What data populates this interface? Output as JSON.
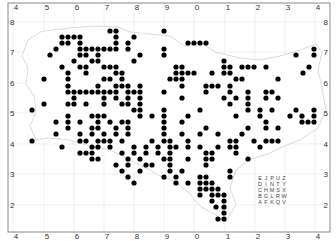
{
  "map": {
    "type": "dot-distribution-map",
    "frame": {
      "left": 8,
      "top": 3,
      "right": 330,
      "bottom": 232
    },
    "colors": {
      "dot": "#000000",
      "grid": "#e6e6e6",
      "coast": "#cfcfcf",
      "frame": "#888888",
      "text": "#333333",
      "land": "#ffffff"
    },
    "x_ticks": [
      {
        "label": "4",
        "x": 16
      },
      {
        "label": "5",
        "x": 47
      },
      {
        "label": "6",
        "x": 77
      },
      {
        "label": "7",
        "x": 107
      },
      {
        "label": "8",
        "x": 137
      },
      {
        "label": "9",
        "x": 167
      },
      {
        "label": "0",
        "x": 197
      },
      {
        "label": "1",
        "x": 228
      },
      {
        "label": "2",
        "x": 258
      },
      {
        "label": "3",
        "x": 288
      },
      {
        "label": "4",
        "x": 318
      }
    ],
    "y_ticks": [
      {
        "label": "8",
        "y": 22
      },
      {
        "label": "7",
        "y": 52
      },
      {
        "label": "6",
        "y": 83
      },
      {
        "label": "5",
        "y": 113
      },
      {
        "label": "4",
        "y": 144
      },
      {
        "label": "3",
        "y": 174
      },
      {
        "label": "2",
        "y": 205
      }
    ],
    "legend_grid": {
      "x": 257,
      "y": 175,
      "cell": 6,
      "rows": [
        [
          "E",
          "J",
          "P",
          "U",
          "Z"
        ],
        [
          "D",
          "I",
          "N",
          "T",
          "Y"
        ],
        [
          "C",
          "H",
          "M",
          "S",
          "X"
        ],
        [
          "B",
          "G",
          "L",
          "R",
          "W"
        ],
        [
          "A",
          "F",
          "K",
          "Q",
          "V"
        ]
      ]
    },
    "dots": [
      [
        110,
        31
      ],
      [
        116,
        31
      ],
      [
        164,
        31
      ],
      [
        62,
        37
      ],
      [
        68,
        37
      ],
      [
        74,
        37
      ],
      [
        80,
        37
      ],
      [
        116,
        37
      ],
      [
        134,
        37
      ],
      [
        188,
        43
      ],
      [
        194,
        43
      ],
      [
        200,
        43
      ],
      [
        206,
        43
      ],
      [
        62,
        43
      ],
      [
        68,
        43
      ],
      [
        80,
        43
      ],
      [
        116,
        43
      ],
      [
        128,
        43
      ],
      [
        56,
        49
      ],
      [
        80,
        49
      ],
      [
        86,
        49
      ],
      [
        92,
        49
      ],
      [
        98,
        49
      ],
      [
        104,
        49
      ],
      [
        110,
        49
      ],
      [
        116,
        49
      ],
      [
        128,
        49
      ],
      [
        164,
        49
      ],
      [
        314,
        49
      ],
      [
        50,
        55
      ],
      [
        80,
        55
      ],
      [
        86,
        55
      ],
      [
        98,
        55
      ],
      [
        140,
        55
      ],
      [
        164,
        55
      ],
      [
        296,
        55
      ],
      [
        314,
        55
      ],
      [
        74,
        61
      ],
      [
        92,
        61
      ],
      [
        98,
        61
      ],
      [
        134,
        61
      ],
      [
        224,
        61
      ],
      [
        62,
        67
      ],
      [
        80,
        67
      ],
      [
        86,
        67
      ],
      [
        104,
        67
      ],
      [
        110,
        67
      ],
      [
        116,
        67
      ],
      [
        176,
        67
      ],
      [
        182,
        67
      ],
      [
        224,
        67
      ],
      [
        230,
        67
      ],
      [
        242,
        67
      ],
      [
        248,
        67
      ],
      [
        254,
        67
      ],
      [
        266,
        67
      ],
      [
        309,
        67
      ],
      [
        68,
        73
      ],
      [
        86,
        73
      ],
      [
        116,
        73
      ],
      [
        122,
        73
      ],
      [
        176,
        73
      ],
      [
        182,
        73
      ],
      [
        188,
        73
      ],
      [
        194,
        73
      ],
      [
        212,
        73
      ],
      [
        224,
        73
      ],
      [
        230,
        73
      ],
      [
        303,
        73
      ],
      [
        44,
        79
      ],
      [
        68,
        79
      ],
      [
        104,
        79
      ],
      [
        110,
        79
      ],
      [
        122,
        79
      ],
      [
        170,
        79
      ],
      [
        176,
        79
      ],
      [
        182,
        79
      ],
      [
        236,
        79
      ],
      [
        242,
        79
      ],
      [
        278,
        79
      ],
      [
        68,
        86
      ],
      [
        98,
        86
      ],
      [
        116,
        86
      ],
      [
        122,
        86
      ],
      [
        128,
        86
      ],
      [
        140,
        86
      ],
      [
        182,
        86
      ],
      [
        206,
        86
      ],
      [
        212,
        86
      ],
      [
        218,
        86
      ],
      [
        230,
        86
      ],
      [
        68,
        92
      ],
      [
        74,
        92
      ],
      [
        80,
        92
      ],
      [
        86,
        92
      ],
      [
        92,
        92
      ],
      [
        98,
        92
      ],
      [
        104,
        92
      ],
      [
        110,
        92
      ],
      [
        116,
        92
      ],
      [
        128,
        92
      ],
      [
        134,
        92
      ],
      [
        140,
        92
      ],
      [
        164,
        92
      ],
      [
        206,
        92
      ],
      [
        230,
        92
      ],
      [
        248,
        92
      ],
      [
        266,
        92
      ],
      [
        272,
        92
      ],
      [
        74,
        98
      ],
      [
        104,
        98
      ],
      [
        116,
        98
      ],
      [
        128,
        98
      ],
      [
        140,
        98
      ],
      [
        182,
        98
      ],
      [
        224,
        98
      ],
      [
        236,
        98
      ],
      [
        248,
        98
      ],
      [
        266,
        98
      ],
      [
        278,
        98
      ],
      [
        44,
        104
      ],
      [
        68,
        104
      ],
      [
        74,
        104
      ],
      [
        86,
        104
      ],
      [
        104,
        104
      ],
      [
        122,
        104
      ],
      [
        128,
        104
      ],
      [
        140,
        104
      ],
      [
        230,
        104
      ],
      [
        248,
        104
      ],
      [
        32,
        110
      ],
      [
        134,
        110
      ],
      [
        140,
        110
      ],
      [
        164,
        110
      ],
      [
        200,
        110
      ],
      [
        248,
        110
      ],
      [
        260,
        110
      ],
      [
        272,
        110
      ],
      [
        296,
        110
      ],
      [
        314,
        110
      ],
      [
        68,
        116
      ],
      [
        92,
        116
      ],
      [
        98,
        116
      ],
      [
        104,
        116
      ],
      [
        140,
        116
      ],
      [
        152,
        116
      ],
      [
        164,
        116
      ],
      [
        188,
        116
      ],
      [
        236,
        116
      ],
      [
        260,
        116
      ],
      [
        290,
        116
      ],
      [
        302,
        116
      ],
      [
        314,
        116
      ],
      [
        56,
        122
      ],
      [
        68,
        122
      ],
      [
        80,
        122
      ],
      [
        98,
        122
      ],
      [
        110,
        122
      ],
      [
        122,
        122
      ],
      [
        128,
        122
      ],
      [
        164,
        122
      ],
      [
        182,
        122
      ],
      [
        266,
        122
      ],
      [
        302,
        122
      ],
      [
        308,
        122
      ],
      [
        314,
        122
      ],
      [
        68,
        128
      ],
      [
        92,
        128
      ],
      [
        98,
        128
      ],
      [
        116,
        128
      ],
      [
        128,
        128
      ],
      [
        164,
        128
      ],
      [
        206,
        128
      ],
      [
        248,
        128
      ],
      [
        266,
        128
      ],
      [
        278,
        128
      ],
      [
        56,
        134
      ],
      [
        80,
        134
      ],
      [
        92,
        134
      ],
      [
        104,
        134
      ],
      [
        116,
        134
      ],
      [
        128,
        134
      ],
      [
        164,
        134
      ],
      [
        182,
        134
      ],
      [
        200,
        134
      ],
      [
        218,
        134
      ],
      [
        242,
        134
      ],
      [
        32,
        141
      ],
      [
        80,
        141
      ],
      [
        86,
        141
      ],
      [
        98,
        141
      ],
      [
        104,
        141
      ],
      [
        110,
        141
      ],
      [
        122,
        141
      ],
      [
        152,
        141
      ],
      [
        164,
        141
      ],
      [
        170,
        141
      ],
      [
        188,
        141
      ],
      [
        230,
        141
      ],
      [
        236,
        141
      ],
      [
        254,
        141
      ],
      [
        266,
        141
      ],
      [
        272,
        141
      ],
      [
        278,
        141
      ],
      [
        62,
        147
      ],
      [
        92,
        147
      ],
      [
        98,
        147
      ],
      [
        110,
        147
      ],
      [
        134,
        147
      ],
      [
        146,
        147
      ],
      [
        158,
        147
      ],
      [
        170,
        147
      ],
      [
        176,
        147
      ],
      [
        188,
        147
      ],
      [
        200,
        147
      ],
      [
        218,
        147
      ],
      [
        230,
        147
      ],
      [
        236,
        147
      ],
      [
        260,
        147
      ],
      [
        80,
        153
      ],
      [
        86,
        153
      ],
      [
        92,
        153
      ],
      [
        122,
        153
      ],
      [
        134,
        153
      ],
      [
        146,
        153
      ],
      [
        158,
        153
      ],
      [
        170,
        153
      ],
      [
        206,
        153
      ],
      [
        212,
        153
      ],
      [
        236,
        153
      ],
      [
        92,
        159
      ],
      [
        98,
        159
      ],
      [
        128,
        159
      ],
      [
        140,
        159
      ],
      [
        164,
        159
      ],
      [
        170,
        159
      ],
      [
        188,
        159
      ],
      [
        206,
        159
      ],
      [
        212,
        159
      ],
      [
        248,
        159
      ],
      [
        116,
        165
      ],
      [
        128,
        165
      ],
      [
        146,
        165
      ],
      [
        152,
        165
      ],
      [
        170,
        165
      ],
      [
        206,
        165
      ],
      [
        122,
        171
      ],
      [
        140,
        171
      ],
      [
        170,
        171
      ],
      [
        182,
        171
      ],
      [
        230,
        171
      ],
      [
        128,
        177
      ],
      [
        164,
        177
      ],
      [
        176,
        177
      ],
      [
        200,
        177
      ],
      [
        206,
        177
      ],
      [
        230,
        177
      ],
      [
        134,
        183
      ],
      [
        176,
        183
      ],
      [
        188,
        183
      ],
      [
        200,
        183
      ],
      [
        206,
        183
      ],
      [
        212,
        183
      ],
      [
        200,
        189
      ],
      [
        206,
        189
      ],
      [
        212,
        189
      ],
      [
        218,
        189
      ],
      [
        200,
        195
      ],
      [
        212,
        195
      ],
      [
        218,
        195
      ],
      [
        224,
        195
      ],
      [
        212,
        201
      ],
      [
        224,
        201
      ],
      [
        216,
        207
      ],
      [
        224,
        207
      ],
      [
        224,
        213
      ],
      [
        224,
        219
      ],
      [
        218,
        219
      ]
    ]
  }
}
